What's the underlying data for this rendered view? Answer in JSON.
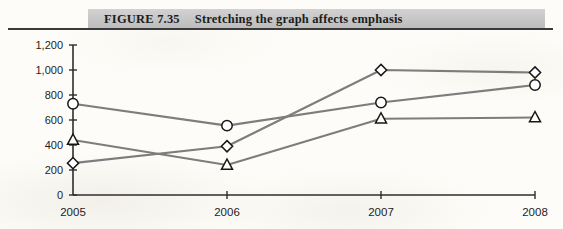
{
  "caption": {
    "label": "FIGURE 7.35",
    "title": "Stretching the graph affects emphasis"
  },
  "chart_data": {
    "type": "line",
    "title": "Stretching the graph affects emphasis",
    "xlabel": "",
    "ylabel": "",
    "categories": [
      "2005",
      "2006",
      "2007",
      "2008"
    ],
    "x": [
      2005,
      2006,
      2007,
      2008
    ],
    "ylim": [
      0,
      1200
    ],
    "yticks": [
      0,
      200,
      400,
      600,
      800,
      1000,
      1200
    ],
    "ytick_labels": [
      "0",
      "200",
      "400",
      "600",
      "800",
      "1,000",
      "1,200"
    ],
    "grid": false,
    "legend": "none",
    "line_color": "#7d7d7d",
    "marker_fill": "#ffffff",
    "marker_stroke": "#171717",
    "series": [
      {
        "name": "series-circle",
        "marker": "circle",
        "values": [
          730,
          555,
          740,
          880
        ]
      },
      {
        "name": "series-diamond",
        "marker": "diamond",
        "values": [
          255,
          390,
          1000,
          980
        ]
      },
      {
        "name": "series-triangle",
        "marker": "triangle",
        "values": [
          440,
          240,
          610,
          620
        ]
      }
    ]
  }
}
